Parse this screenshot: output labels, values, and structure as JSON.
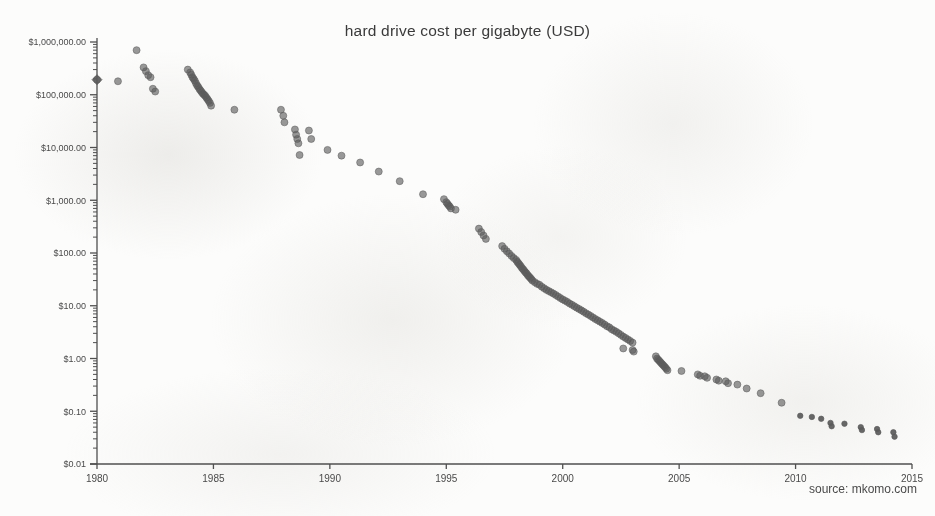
{
  "chart": {
    "title": "hard drive cost per gigabyte (USD)",
    "source": "source: mkomo.com"
  },
  "chart_data": {
    "type": "scatter",
    "title": "hard drive cost per gigabyte (USD)",
    "xlabel": "",
    "ylabel": "",
    "yscale": "log",
    "xlim": [
      1980,
      2015
    ],
    "ylim": [
      0.01,
      1000000
    ],
    "grid": false,
    "legend": null,
    "annotations": [
      "source: mkomo.com"
    ],
    "xticks": [
      1980,
      1985,
      1990,
      1995,
      2000,
      2005,
      2010,
      2015
    ],
    "xticklabels": [
      "1980",
      "1985",
      "1990",
      "1995",
      "2000",
      "2005",
      "2010",
      "2015"
    ],
    "yticks": [
      1000000,
      100000,
      10000,
      1000,
      100,
      10,
      1,
      0.1,
      0.01
    ],
    "yticklabels": [
      "$1,000,000.00",
      "$100,000.00",
      "$10,000.00",
      "$1,000.00",
      "$100.00",
      "$10.00",
      "$1.00",
      "$0.10",
      "$0.01"
    ],
    "minor_ticks": true,
    "marker": {
      "shape": "circle",
      "color": "#5a5a5a",
      "opacity": 0.62,
      "size": 7
    },
    "points": [
      [
        1980.0,
        193000
      ],
      [
        1980.9,
        180000
      ],
      [
        1981.7,
        700000
      ],
      [
        1982.0,
        330000
      ],
      [
        1982.1,
        280000
      ],
      [
        1982.2,
        235000
      ],
      [
        1982.3,
        215000
      ],
      [
        1982.4,
        130000
      ],
      [
        1982.5,
        115000
      ],
      [
        1983.9,
        300000
      ],
      [
        1984.0,
        265000
      ],
      [
        1984.05,
        240000
      ],
      [
        1984.1,
        215000
      ],
      [
        1984.15,
        200000
      ],
      [
        1984.2,
        185000
      ],
      [
        1984.25,
        165000
      ],
      [
        1984.3,
        150000
      ],
      [
        1984.35,
        140000
      ],
      [
        1984.4,
        128000
      ],
      [
        1984.45,
        120000
      ],
      [
        1984.5,
        112000
      ],
      [
        1984.55,
        105000
      ],
      [
        1984.6,
        100000
      ],
      [
        1984.65,
        95000
      ],
      [
        1984.7,
        88000
      ],
      [
        1984.75,
        82000
      ],
      [
        1984.8,
        76000
      ],
      [
        1984.85,
        70000
      ],
      [
        1984.9,
        62000
      ],
      [
        1985.9,
        52000
      ],
      [
        1987.9,
        52000
      ],
      [
        1988.0,
        40000
      ],
      [
        1988.05,
        30000
      ],
      [
        1988.5,
        22000
      ],
      [
        1988.55,
        17500
      ],
      [
        1988.6,
        14500
      ],
      [
        1988.65,
        12000
      ],
      [
        1988.7,
        7200
      ],
      [
        1989.1,
        21000
      ],
      [
        1989.2,
        14500
      ],
      [
        1989.9,
        9000
      ],
      [
        1990.5,
        7000
      ],
      [
        1991.3,
        5200
      ],
      [
        1992.1,
        3500
      ],
      [
        1993.0,
        2300
      ],
      [
        1994.0,
        1300
      ],
      [
        1994.9,
        1050
      ],
      [
        1995.0,
        920
      ],
      [
        1995.05,
        860
      ],
      [
        1995.1,
        800
      ],
      [
        1995.15,
        760
      ],
      [
        1995.2,
        700
      ],
      [
        1995.4,
        660
      ],
      [
        1996.4,
        290
      ],
      [
        1996.5,
        250
      ],
      [
        1996.6,
        215
      ],
      [
        1996.7,
        185
      ],
      [
        1997.4,
        135
      ],
      [
        1997.5,
        120
      ],
      [
        1997.6,
        108
      ],
      [
        1997.7,
        98
      ],
      [
        1997.8,
        88
      ],
      [
        1997.9,
        80
      ],
      [
        1998.0,
        74
      ],
      [
        1998.05,
        68
      ],
      [
        1998.1,
        64
      ],
      [
        1998.15,
        60
      ],
      [
        1998.2,
        56
      ],
      [
        1998.25,
        52
      ],
      [
        1998.3,
        49
      ],
      [
        1998.35,
        46
      ],
      [
        1998.4,
        43
      ],
      [
        1998.45,
        41
      ],
      [
        1998.5,
        38
      ],
      [
        1998.55,
        36
      ],
      [
        1998.6,
        34
      ],
      [
        1998.65,
        32
      ],
      [
        1998.7,
        30
      ],
      [
        1998.8,
        28
      ],
      [
        1998.9,
        26
      ],
      [
        1999.0,
        25
      ],
      [
        1999.1,
        23
      ],
      [
        1999.2,
        21.5
      ],
      [
        1999.3,
        20
      ],
      [
        1999.4,
        19
      ],
      [
        1999.5,
        18
      ],
      [
        1999.6,
        17
      ],
      [
        1999.7,
        16
      ],
      [
        1999.8,
        15
      ],
      [
        1999.9,
        14
      ],
      [
        2000.0,
        13.2
      ],
      [
        2000.1,
        12.5
      ],
      [
        2000.2,
        11.8
      ],
      [
        2000.3,
        11.0
      ],
      [
        2000.4,
        10.4
      ],
      [
        2000.5,
        9.8
      ],
      [
        2000.6,
        9.2
      ],
      [
        2000.7,
        8.7
      ],
      [
        2000.8,
        8.2
      ],
      [
        2000.9,
        7.7
      ],
      [
        2001.0,
        7.2
      ],
      [
        2001.1,
        6.8
      ],
      [
        2001.2,
        6.4
      ],
      [
        2001.3,
        6.0
      ],
      [
        2001.4,
        5.6
      ],
      [
        2001.5,
        5.3
      ],
      [
        2001.6,
        5.0
      ],
      [
        2001.7,
        4.7
      ],
      [
        2001.8,
        4.4
      ],
      [
        2001.9,
        4.1
      ],
      [
        2002.0,
        3.9
      ],
      [
        2002.1,
        3.6
      ],
      [
        2002.2,
        3.4
      ],
      [
        2002.3,
        3.2
      ],
      [
        2002.4,
        3.0
      ],
      [
        2002.5,
        2.8
      ],
      [
        2002.6,
        2.6
      ],
      [
        2002.7,
        2.45
      ],
      [
        2002.8,
        2.3
      ],
      [
        2002.9,
        2.15
      ],
      [
        2003.0,
        2.0
      ],
      [
        2002.6,
        1.55
      ],
      [
        2003.0,
        1.45
      ],
      [
        2003.05,
        1.35
      ],
      [
        2004.0,
        1.1
      ],
      [
        2004.05,
        1.0
      ],
      [
        2004.1,
        0.95
      ],
      [
        2004.15,
        0.9
      ],
      [
        2004.2,
        0.85
      ],
      [
        2004.25,
        0.8
      ],
      [
        2004.3,
        0.76
      ],
      [
        2004.35,
        0.72
      ],
      [
        2004.4,
        0.68
      ],
      [
        2004.45,
        0.64
      ],
      [
        2004.5,
        0.6
      ],
      [
        2005.1,
        0.58
      ],
      [
        2005.8,
        0.5
      ],
      [
        2005.9,
        0.47
      ],
      [
        2006.1,
        0.46
      ],
      [
        2006.2,
        0.43
      ],
      [
        2006.6,
        0.4
      ],
      [
        2006.7,
        0.38
      ],
      [
        2007.0,
        0.37
      ],
      [
        2007.1,
        0.34
      ],
      [
        2007.5,
        0.32
      ],
      [
        2007.9,
        0.27
      ],
      [
        2008.5,
        0.22
      ],
      [
        2009.4,
        0.145
      ],
      [
        2010.2,
        0.082
      ],
      [
        2010.7,
        0.078
      ],
      [
        2011.1,
        0.072
      ],
      [
        2011.5,
        0.06
      ],
      [
        2011.55,
        0.052
      ],
      [
        2012.1,
        0.058
      ],
      [
        2012.8,
        0.05
      ],
      [
        2012.85,
        0.044
      ],
      [
        2013.5,
        0.046
      ],
      [
        2013.55,
        0.04
      ],
      [
        2014.2,
        0.04
      ],
      [
        2014.25,
        0.033
      ]
    ]
  }
}
